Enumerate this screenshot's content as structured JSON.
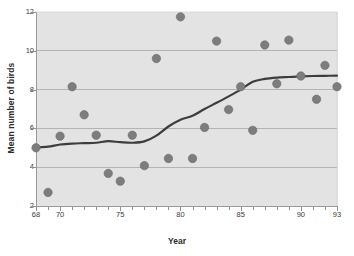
{
  "chart_data": {
    "type": "scatter",
    "title": "",
    "xlabel": "Year",
    "ylabel": "Mean number of birds",
    "xlim": [
      68,
      93
    ],
    "ylim": [
      2,
      12
    ],
    "grid": "horizontal",
    "legend": "none",
    "xticks": [
      68,
      70,
      75,
      80,
      85,
      90,
      93
    ],
    "xtick_labels": [
      "68",
      "70",
      "75",
      "80",
      "85",
      "90",
      "93"
    ],
    "xticks_minor": [
      69,
      71,
      72,
      73,
      74,
      76,
      77,
      78,
      79,
      81,
      82,
      83,
      84,
      86,
      87,
      88,
      89,
      91,
      92
    ],
    "yticks": [
      2,
      4,
      6,
      8,
      10,
      12
    ],
    "ytick_labels": [
      "2",
      "4",
      "6",
      "8",
      "10",
      "12"
    ],
    "gridlines": [
      4,
      6,
      8,
      10
    ],
    "marker_color": "#7d7d7d",
    "marker_edge_color": "#6a6a6a",
    "marker_size": 4.2,
    "line_color": "#3d3d3d",
    "line_width": 2.2,
    "plot_background": "#e3e3e3",
    "axis_color": "#9a9a9a",
    "grid_color": "#9e9e9e",
    "series": [
      {
        "name": "Mean number of birds",
        "x": [
          68,
          69,
          70,
          71,
          72,
          73,
          74,
          75,
          76,
          77,
          78,
          79,
          80,
          81,
          82,
          83,
          84,
          85,
          86,
          87,
          88,
          89,
          90,
          91.3,
          92,
          93
        ],
        "y": [
          5.0,
          2.7,
          5.6,
          8.15,
          6.7,
          5.65,
          3.68,
          3.28,
          5.65,
          4.08,
          9.6,
          4.45,
          11.75,
          4.45,
          6.05,
          10.5,
          6.97,
          8.15,
          5.9,
          10.3,
          8.3,
          10.55,
          8.7,
          7.5,
          9.25,
          8.15
        ]
      }
    ],
    "smooth_fit": {
      "name": "smoothed trend",
      "x": [
        68,
        69,
        70,
        71,
        72,
        73,
        74,
        75,
        76,
        77,
        78,
        79,
        80,
        81,
        82,
        83,
        84,
        85,
        86,
        87,
        88,
        89,
        90,
        91,
        92,
        93
      ],
      "y": [
        5.02,
        5.06,
        5.17,
        5.22,
        5.24,
        5.26,
        5.34,
        5.29,
        5.26,
        5.33,
        5.63,
        6.1,
        6.45,
        6.65,
        7.0,
        7.32,
        7.65,
        8.0,
        8.4,
        8.55,
        8.62,
        8.65,
        8.68,
        8.7,
        8.71,
        8.72
      ]
    }
  },
  "axes": {
    "xlabel": "Year",
    "ylabel": "Mean number of birds"
  }
}
